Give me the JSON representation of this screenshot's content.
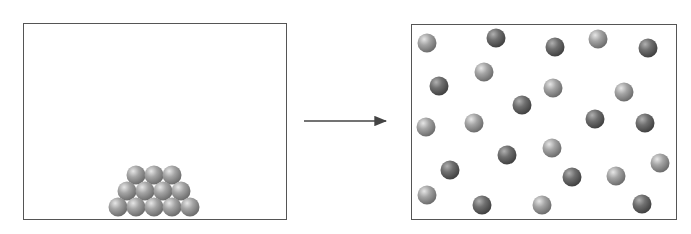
{
  "diagram": {
    "colors": {
      "border": "#555555",
      "arrow": "#444444",
      "particle_light": "#9a9a9a",
      "particle_dark": "#6a6a6a"
    },
    "left_container": {
      "label": "",
      "particles": [
        {
          "x": 136,
          "y": 175,
          "tone": "light"
        },
        {
          "x": 154,
          "y": 175,
          "tone": "light"
        },
        {
          "x": 172,
          "y": 175,
          "tone": "light"
        },
        {
          "x": 127,
          "y": 191,
          "tone": "light"
        },
        {
          "x": 145,
          "y": 191,
          "tone": "light"
        },
        {
          "x": 163,
          "y": 191,
          "tone": "light"
        },
        {
          "x": 181,
          "y": 191,
          "tone": "light"
        },
        {
          "x": 118,
          "y": 207,
          "tone": "light"
        },
        {
          "x": 136,
          "y": 207,
          "tone": "light"
        },
        {
          "x": 154,
          "y": 207,
          "tone": "light"
        },
        {
          "x": 172,
          "y": 207,
          "tone": "light"
        },
        {
          "x": 190,
          "y": 207,
          "tone": "light"
        }
      ]
    },
    "arrow": {
      "x1": 304,
      "y1": 121,
      "x2": 386,
      "y2": 121
    },
    "right_container": {
      "label": "",
      "particles": [
        {
          "x": 427,
          "y": 43,
          "tone": "light"
        },
        {
          "x": 496,
          "y": 38,
          "tone": "dark"
        },
        {
          "x": 555,
          "y": 47,
          "tone": "dark"
        },
        {
          "x": 598,
          "y": 39,
          "tone": "light"
        },
        {
          "x": 648,
          "y": 48,
          "tone": "dark"
        },
        {
          "x": 439,
          "y": 86,
          "tone": "dark"
        },
        {
          "x": 484,
          "y": 72,
          "tone": "light"
        },
        {
          "x": 553,
          "y": 88,
          "tone": "light"
        },
        {
          "x": 624,
          "y": 92,
          "tone": "light"
        },
        {
          "x": 522,
          "y": 105,
          "tone": "dark"
        },
        {
          "x": 426,
          "y": 127,
          "tone": "light"
        },
        {
          "x": 474,
          "y": 123,
          "tone": "light"
        },
        {
          "x": 595,
          "y": 119,
          "tone": "dark"
        },
        {
          "x": 645,
          "y": 123,
          "tone": "dark"
        },
        {
          "x": 507,
          "y": 155,
          "tone": "dark"
        },
        {
          "x": 552,
          "y": 148,
          "tone": "light"
        },
        {
          "x": 660,
          "y": 163,
          "tone": "light"
        },
        {
          "x": 450,
          "y": 170,
          "tone": "dark"
        },
        {
          "x": 572,
          "y": 177,
          "tone": "dark"
        },
        {
          "x": 616,
          "y": 176,
          "tone": "light"
        },
        {
          "x": 427,
          "y": 195,
          "tone": "light"
        },
        {
          "x": 482,
          "y": 205,
          "tone": "dark"
        },
        {
          "x": 542,
          "y": 205,
          "tone": "light"
        },
        {
          "x": 642,
          "y": 204,
          "tone": "dark"
        }
      ]
    },
    "particle_radius": 9.5
  }
}
